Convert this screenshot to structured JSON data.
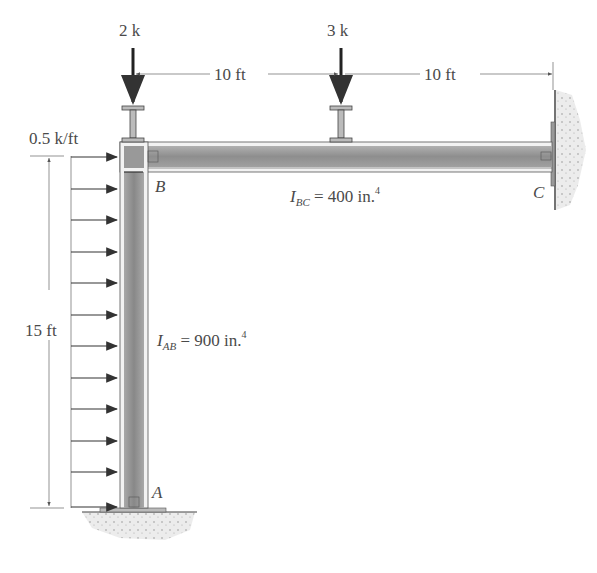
{
  "figure": {
    "loads": {
      "point_load_1": "2 k",
      "point_load_2": "3 k",
      "distributed_load": "0.5 k/ft"
    },
    "dimensions": {
      "span_1": "10 ft",
      "span_2": "10 ft",
      "column_height": "15 ft"
    },
    "joints": {
      "a": "A",
      "b": "B",
      "c": "C"
    },
    "properties": {
      "beam_bc": {
        "symbol": "I",
        "subscript": "BC",
        "value": "= 400 in.",
        "exponent": "4"
      },
      "column_ab": {
        "symbol": "I",
        "subscript": "AB",
        "value": "= 900 in.",
        "exponent": "4"
      }
    },
    "colors": {
      "member_fill": "#9a9a9a",
      "line": "#333333",
      "text": "#4a4a4a",
      "ground": "#d8d8d8"
    }
  }
}
